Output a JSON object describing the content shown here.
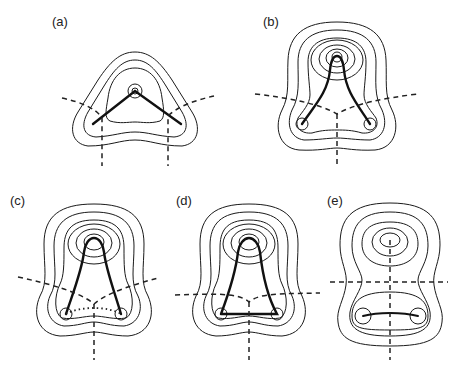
{
  "figure": {
    "panels": [
      {
        "id": "a",
        "label": "(a)",
        "description": "triangular contour, bent bonds from apex atom to two base atoms"
      },
      {
        "id": "b",
        "label": "(b)",
        "description": "pear-shaped contours, curved bonds from apex to base atoms"
      },
      {
        "id": "c",
        "label": "(c)",
        "description": "curved bonds with dotted base bond path"
      },
      {
        "id": "d",
        "label": "(d)",
        "description": "curved bonds with solid base bond path"
      },
      {
        "id": "e",
        "label": "(e)",
        "description": "separated top atom, only base bond present"
      }
    ],
    "colors": {
      "ink": "#1a1a1a",
      "background": "#ffffff"
    }
  }
}
